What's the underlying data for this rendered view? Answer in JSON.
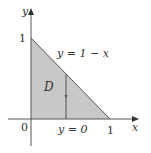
{
  "diagram": {
    "type": "region-plot",
    "region_label": "D",
    "axes": {
      "x_label": "x",
      "y_label": "y",
      "origin_label": "0",
      "x_tick_label": "1",
      "y_tick_label": "1"
    },
    "boundaries": {
      "upper": "y = 1 − x",
      "lower": "y = 0"
    },
    "vertices": [
      [
        0,
        0
      ],
      [
        1,
        0
      ],
      [
        0,
        1
      ]
    ],
    "colors": {
      "region_fill": "#c8c8c8",
      "stroke": "#555555",
      "text": "#333333"
    }
  }
}
